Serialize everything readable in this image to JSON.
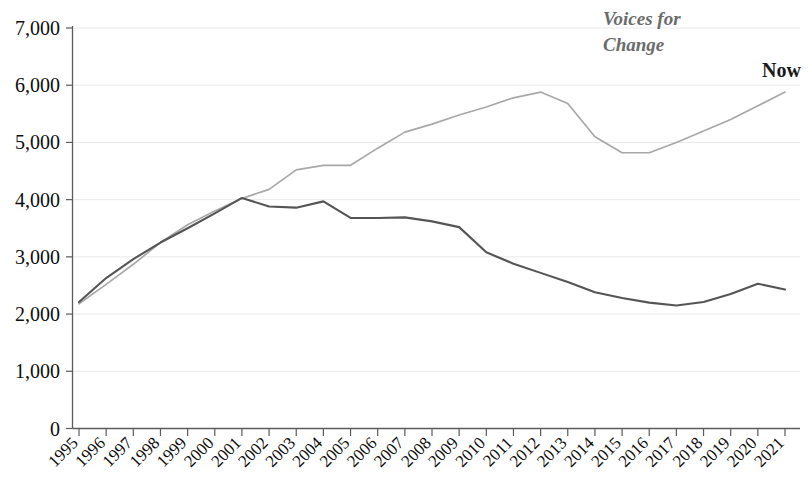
{
  "chart_data": {
    "type": "line",
    "title": "",
    "xlabel": "",
    "ylabel": "",
    "grid": true,
    "legend_position": "inline-right",
    "ylim": [
      0,
      7000
    ],
    "ytick_labels": [
      "7,000",
      "6,000",
      "5,000",
      "4,000",
      "3,000",
      "2,000",
      "1,000",
      "0"
    ],
    "ytick_values": [
      7000,
      6000,
      5000,
      4000,
      3000,
      2000,
      1000,
      0
    ],
    "categories": [
      "1995",
      "1996",
      "1997",
      "1998",
      "1999",
      "2000",
      "2001",
      "2002",
      "2003",
      "2004",
      "2005",
      "2006",
      "2007",
      "2008",
      "2009",
      "2010",
      "2011",
      "2012",
      "2013",
      "2014",
      "2015",
      "2016",
      "2017",
      "2018",
      "2019",
      "2020",
      "2021"
    ],
    "x": [
      1995,
      1996,
      1997,
      1998,
      1999,
      2000,
      2001,
      2002,
      2003,
      2004,
      2005,
      2006,
      2007,
      2008,
      2009,
      2010,
      2011,
      2012,
      2013,
      2014,
      2015,
      2016,
      2017,
      2018,
      2019,
      2020,
      2021
    ],
    "series": [
      {
        "name": "Voices for Change",
        "color": "#a8a8a8",
        "label_lines": [
          "Voices for",
          "Change"
        ],
        "values": [
          2180,
          2520,
          2870,
          3250,
          3560,
          3800,
          4020,
          4180,
          4520,
          4600,
          4600,
          4900,
          5180,
          5320,
          5480,
          5620,
          5780,
          5880,
          5680,
          5100,
          4820,
          4820,
          5000,
          5200,
          5400,
          5640,
          5880
        ]
      },
      {
        "name": "Now",
        "color": "#555555",
        "label_lines": [
          "Now"
        ],
        "values": [
          2210,
          2630,
          2960,
          3250,
          3500,
          3760,
          4030,
          3880,
          3860,
          3970,
          3680,
          3680,
          3690,
          3620,
          3520,
          3080,
          2880,
          2720,
          2560,
          2380,
          2280,
          2200,
          2150,
          2210,
          2350,
          2530,
          2430
        ]
      }
    ]
  },
  "labels": {
    "voices_line1": "Voices for",
    "voices_line2": "Change",
    "now": "Now"
  },
  "axis": {
    "y_ticks": [
      "7,000",
      "6,000",
      "5,000",
      "4,000",
      "3,000",
      "2,000",
      "1,000",
      "0"
    ],
    "x_ticks": [
      "1995",
      "1996",
      "1997",
      "1998",
      "1999",
      "2000",
      "2001",
      "2002",
      "2003",
      "2004",
      "2005",
      "2006",
      "2007",
      "2008",
      "2009",
      "2010",
      "2011",
      "2012",
      "2013",
      "2014",
      "2015",
      "2016",
      "2017",
      "2018",
      "2019",
      "2020",
      "2021"
    ]
  },
  "colors": {
    "voices": "#a8a8a8",
    "now": "#555555",
    "axis": "#5b5b5b",
    "grid": "#e9e9ec",
    "text": "#0d0d0d",
    "voices_label": "#6b6b6b"
  }
}
